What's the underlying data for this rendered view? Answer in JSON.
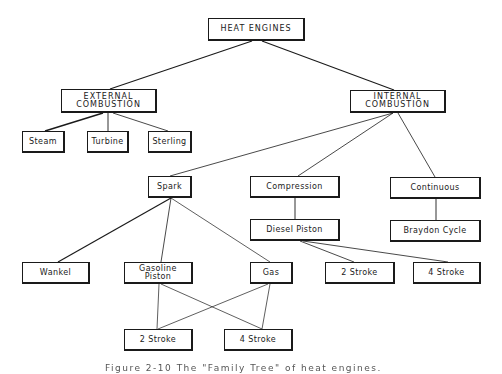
{
  "diagram": {
    "nodes": {
      "heat_engines": "HEAT ENGINES",
      "external_combustion": "EXTERNAL\nCOMBUSTION",
      "internal_combustion": "INTERNAL\nCOMBUSTION",
      "steam": "Steam",
      "turbine": "Turbine",
      "sterling": "Sterling",
      "spark": "Spark",
      "compression": "Compression",
      "continuous": "Continuous",
      "diesel_piston": "Diesel Piston",
      "braydon_cycle": "Braydon Cycle",
      "wankel": "Wankel",
      "gasoline_piston": "Gasoline\nPiston",
      "gas": "Gas",
      "diesel_2_stroke": "2 Stroke",
      "diesel_4_stroke": "4 Stroke",
      "spark_2_stroke": "2 Stroke",
      "spark_4_stroke": "4 Stroke"
    },
    "edges": [
      [
        "heat_engines",
        "external_combustion"
      ],
      [
        "heat_engines",
        "internal_combustion"
      ],
      [
        "external_combustion",
        "steam"
      ],
      [
        "external_combustion",
        "turbine"
      ],
      [
        "external_combustion",
        "sterling"
      ],
      [
        "internal_combustion",
        "spark"
      ],
      [
        "internal_combustion",
        "compression"
      ],
      [
        "internal_combustion",
        "continuous"
      ],
      [
        "compression",
        "diesel_piston"
      ],
      [
        "continuous",
        "braydon_cycle"
      ],
      [
        "spark",
        "wankel"
      ],
      [
        "spark",
        "gasoline_piston"
      ],
      [
        "spark",
        "gas"
      ],
      [
        "diesel_piston",
        "diesel_2_stroke"
      ],
      [
        "diesel_piston",
        "diesel_4_stroke"
      ],
      [
        "gasoline_piston",
        "spark_2_stroke"
      ],
      [
        "gasoline_piston",
        "spark_4_stroke"
      ],
      [
        "gas",
        "spark_2_stroke"
      ],
      [
        "gas",
        "spark_4_stroke"
      ]
    ],
    "caption": "Figure 2-10   The \"Family Tree\" of heat engines."
  }
}
